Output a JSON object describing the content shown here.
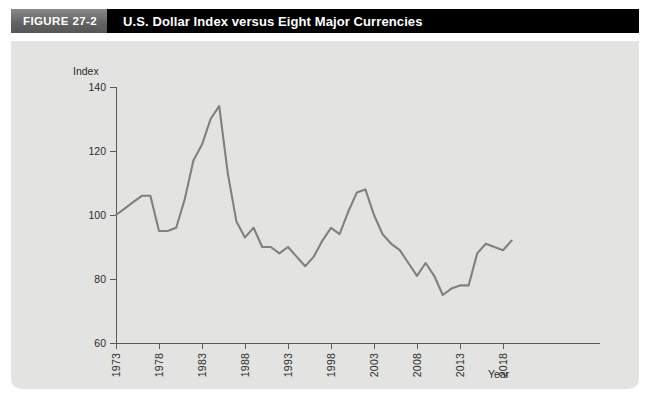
{
  "figure": {
    "number_label": "FIGURE 27-2",
    "title": "U.S. Dollar Index versus Eight Major Currencies"
  },
  "axes": {
    "y_title": "Index",
    "x_title": "Year",
    "y_ticks": [
      "60",
      "80",
      "100",
      "120",
      "140"
    ],
    "x_ticks": [
      "1973",
      "1978",
      "1983",
      "1988",
      "1993",
      "1998",
      "2003",
      "2008",
      "2013",
      "2018"
    ]
  },
  "colors": {
    "panel_background": "#e3e3e1",
    "header_bar": "#000000",
    "figure_number_box": "#6e6e6e",
    "series_line": "#808080",
    "axis": "#5a5a5a",
    "text": "#2c2c2c"
  },
  "caption_partial": "",
  "chart_data": {
    "type": "line",
    "title": "U.S. Dollar Index versus Eight Major Currencies",
    "xlabel": "Year",
    "ylabel": "Index",
    "xlim": [
      1973,
      2019
    ],
    "ylim": [
      60,
      140
    ],
    "grid": false,
    "legend": "none",
    "series": [
      {
        "name": "U.S. Dollar Index (Eight Major Currencies)",
        "x": [
          1973,
          1974,
          1975,
          1976,
          1977,
          1978,
          1979,
          1980,
          1981,
          1982,
          1983,
          1984,
          1985,
          1986,
          1987,
          1988,
          1989,
          1990,
          1991,
          1992,
          1993,
          1994,
          1995,
          1996,
          1997,
          1998,
          1999,
          2000,
          2001,
          2002,
          2003,
          2004,
          2005,
          2006,
          2007,
          2008,
          2009,
          2010,
          2011,
          2012,
          2013,
          2014,
          2015,
          2016,
          2017,
          2018,
          2019
        ],
        "values": [
          100,
          102,
          104,
          106,
          106,
          95,
          95,
          96,
          105,
          117,
          122,
          130,
          134,
          113,
          98,
          93,
          96,
          90,
          90,
          88,
          90,
          87,
          84,
          87,
          92,
          96,
          94,
          101,
          107,
          108,
          100,
          94,
          91,
          89,
          85,
          81,
          85,
          81,
          75,
          77,
          78,
          78,
          88,
          91,
          90,
          89,
          92
        ]
      }
    ]
  },
  "geometry": {
    "plot_left_px": 105,
    "plot_right_px": 589,
    "plot_top_px": 46,
    "plot_bottom_px": 302,
    "x_first_tick_px": 105,
    "x_px_per_year": 8.6
  }
}
